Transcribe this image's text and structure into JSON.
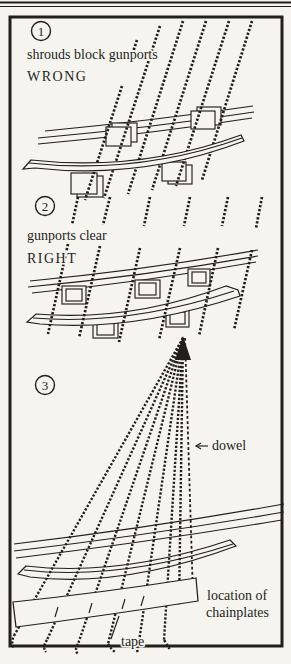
{
  "figure": {
    "ink": "#231f1b",
    "paper": "#f6f4ef"
  },
  "panel1": {
    "number": "1",
    "caption": "shrouds block gunports",
    "verdict": "WRONG"
  },
  "panel2": {
    "number": "2",
    "caption": "gunports clear",
    "verdict": "RIGHT"
  },
  "panel3": {
    "number": "3",
    "dowel_label": "dowel",
    "chainplates_label_line1": "location of",
    "chainplates_label_line2": "chainplates",
    "tape_label": "tape"
  }
}
